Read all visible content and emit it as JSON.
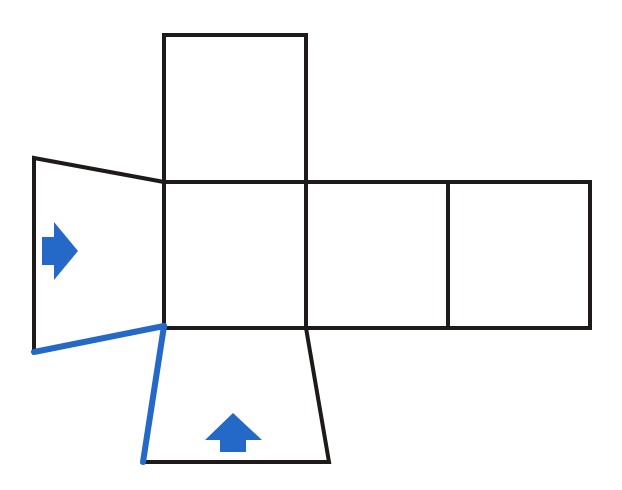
{
  "diagram": {
    "title": "Net of a box with folding flaps",
    "colors": {
      "edge": "#1f1a1a",
      "highlight": "#2468c8",
      "background": "#ffffff"
    },
    "faces": [
      {
        "id": "top-square",
        "shape": "square",
        "points": "164,35 306,35 306,182 164,182"
      },
      {
        "id": "center-square",
        "shape": "square",
        "points": "164,182 306,182 306,328 164,328"
      },
      {
        "id": "right-square-1",
        "shape": "square",
        "points": "306,182 448,182 448,328 306,328"
      },
      {
        "id": "right-square-2",
        "shape": "square",
        "points": "448,182 590,182 590,328 448,328"
      },
      {
        "id": "left-flap",
        "shape": "trapezoid",
        "points": "34,158 164,182 164,326 34,352"
      },
      {
        "id": "bottom-flap",
        "shape": "trapezoid",
        "points": "164,328 306,328 329,462 143,462"
      }
    ],
    "highlighted_edges": [
      {
        "id": "left-flap-bottom-edge",
        "x1": 34,
        "y1": 352,
        "x2": 164,
        "y2": 326
      },
      {
        "id": "bottom-flap-left-edge",
        "x1": 164,
        "y1": 326,
        "x2": 143,
        "y2": 462
      }
    ],
    "arrows": [
      {
        "id": "arrow-right",
        "direction": "right",
        "icon": "arrow-right-icon",
        "points": "42,237 54,237 54,222 78,251 54,280 54,265 42,265"
      },
      {
        "id": "arrow-up",
        "direction": "up",
        "icon": "arrow-up-icon",
        "points": "205,440 220,440 220,452 246,452 246,440 262,440 233,413"
      }
    ]
  }
}
